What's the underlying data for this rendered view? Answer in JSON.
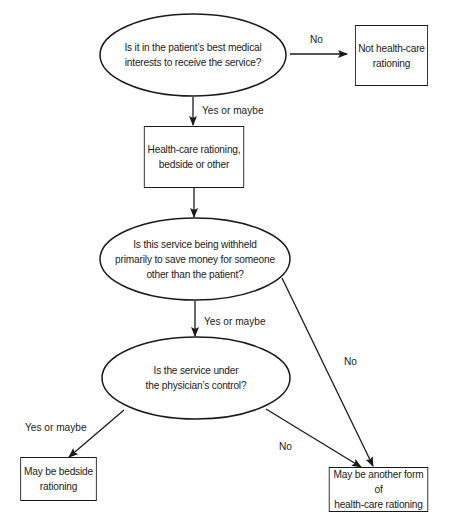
{
  "diagram": {
    "type": "decision-flowchart",
    "nodes": {
      "q1": {
        "shape": "ellipse",
        "text": "Is it in the patient’s best medical\ninterests to receive the service?"
      },
      "not_rationing": {
        "shape": "box",
        "text": "Not health-care\nrationing"
      },
      "rationing": {
        "shape": "box",
        "text": "Health-care rationing,\nbedside or other"
      },
      "q2": {
        "shape": "ellipse",
        "text": "Is this service being withheld\nprimarily to save money for someone\nother than the patient?"
      },
      "q3": {
        "shape": "ellipse",
        "text": "Is the service under\nthe physician’s control?"
      },
      "bedside": {
        "shape": "box",
        "text": "May be bedside\nrationing"
      },
      "other_form": {
        "shape": "box",
        "text": "May be another form of\nhealth-care rationing"
      }
    },
    "edges": [
      {
        "from": "q1",
        "to": "not_rationing",
        "label": "No"
      },
      {
        "from": "q1",
        "to": "rationing",
        "label": "Yes or maybe"
      },
      {
        "from": "rationing",
        "to": "q2",
        "label": ""
      },
      {
        "from": "q2",
        "to": "q3",
        "label": "Yes or maybe"
      },
      {
        "from": "q2",
        "to": "other_form",
        "label": "No"
      },
      {
        "from": "q3",
        "to": "bedside",
        "label": "Yes or maybe"
      },
      {
        "from": "q3",
        "to": "other_form",
        "label": "No"
      }
    ],
    "colors": {
      "stroke": "#1a1a1a",
      "background": "#ffffff"
    }
  }
}
